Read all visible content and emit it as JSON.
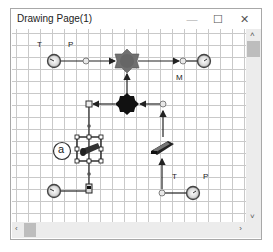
{
  "window": {
    "title": "Drawing Page(1)",
    "minimize_glyph": "—",
    "maximize_glyph": "☐",
    "close_glyph": "✕"
  },
  "canvas": {
    "labels": {
      "top_t": "T",
      "top_p": "P",
      "top_m": "M",
      "bottom_t": "T",
      "bottom_p": "P",
      "circle_a": "a"
    },
    "components": [
      {
        "name": "pressure-gauge-top-left",
        "icon": "gauge-icon"
      },
      {
        "name": "node-dot-top-left",
        "icon": "dot-icon"
      },
      {
        "name": "mixer-gray",
        "icon": "gray-star-icon"
      },
      {
        "name": "node-dot-top-right",
        "icon": "dot-icon"
      },
      {
        "name": "pressure-gauge-top-right",
        "icon": "gauge-icon"
      },
      {
        "name": "splitter-black",
        "icon": "black-diamond-icon"
      },
      {
        "name": "junction-left",
        "icon": "square-node-icon"
      },
      {
        "name": "node-dot-right",
        "icon": "dot-icon"
      },
      {
        "name": "pipe-component-selected",
        "icon": "pipe-icon"
      },
      {
        "name": "pump-component",
        "icon": "pump-icon"
      },
      {
        "name": "pressure-gauge-bottom-left",
        "icon": "gauge-icon"
      },
      {
        "name": "valve-bottom-left",
        "icon": "valve-icon"
      },
      {
        "name": "node-dot-bottom-right",
        "icon": "dot-icon"
      },
      {
        "name": "pressure-gauge-bottom-right",
        "icon": "gauge-icon"
      }
    ]
  },
  "scrollbars": {
    "up": "˄",
    "down": "˅",
    "left": "‹",
    "right": "›"
  },
  "colors": {
    "grid": "#c9c9c9",
    "line": "#222222",
    "gray_node": "#6b6b6b",
    "black_node": "#111111",
    "scroll_track": "#ececec",
    "scroll_thumb": "#bdbdbd"
  }
}
